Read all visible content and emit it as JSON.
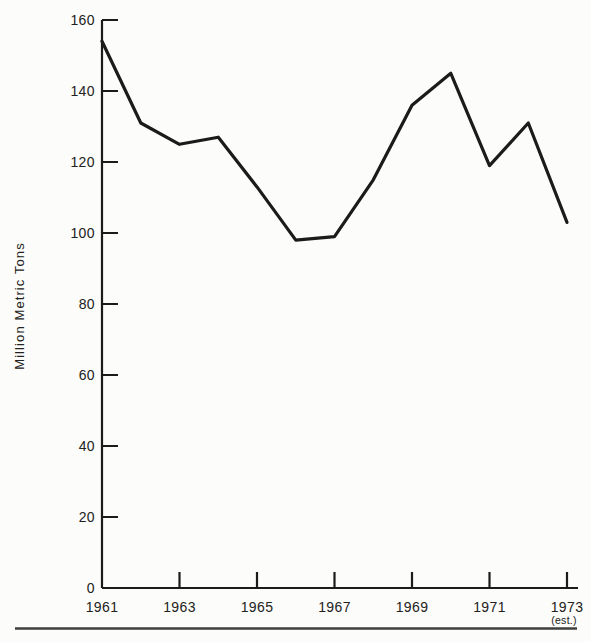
{
  "figure": {
    "background": "#fcfcfa",
    "ink_color": "#1b1b1b",
    "rule_color": "#3f3f3f"
  },
  "chart_data": {
    "type": "line",
    "title": "",
    "xlabel": "",
    "ylabel": "Million Metric Tons",
    "x": [
      1961,
      1962,
      1963,
      1964,
      1965,
      1966,
      1967,
      1968,
      1969,
      1970,
      1971,
      1972,
      1973
    ],
    "values": [
      154,
      131,
      125,
      127,
      113,
      98,
      99,
      115,
      136,
      145,
      119,
      131,
      103
    ],
    "x_tick_labels": [
      "1961",
      "1963",
      "1965",
      "1967",
      "1969",
      "1971",
      "1973"
    ],
    "x_note": "(est.)",
    "x_note_applies_to": "1973",
    "y_ticks": [
      0,
      20,
      40,
      60,
      80,
      100,
      120,
      140,
      160
    ],
    "ylim": [
      0,
      160
    ],
    "xlim": [
      1961,
      1973
    ],
    "grid": false,
    "legend": false,
    "line_color": "#1b1b1b"
  }
}
